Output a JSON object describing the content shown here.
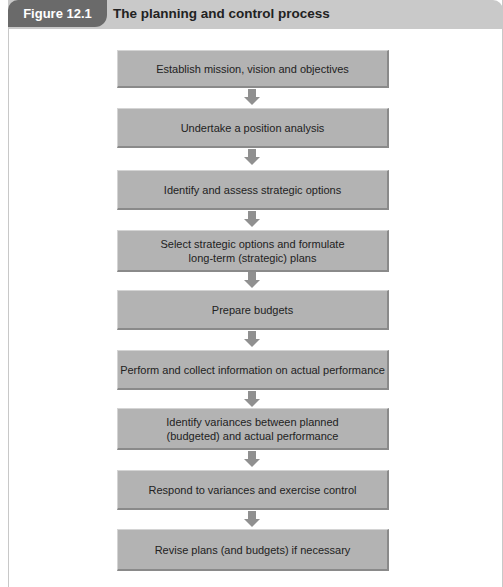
{
  "figure": {
    "label": "Figure 12.1",
    "title": "The planning and control process"
  },
  "steps": [
    {
      "text": "Establish mission, vision and objectives"
    },
    {
      "text": "Undertake a position analysis"
    },
    {
      "text": "Identify and assess strategic options"
    },
    {
      "text": "Select strategic options and formulate long-term (strategic) plans"
    },
    {
      "text": "Prepare budgets"
    },
    {
      "text": "Perform and collect information on actual performance"
    },
    {
      "text": "Identify variances between planned (budgeted) and actual performance"
    },
    {
      "text": "Respond to variances and exercise control"
    },
    {
      "text": "Revise plans (and budgets) if necessary"
    }
  ],
  "colors": {
    "box_fill": "#b3b3b3",
    "arrow": "#909090",
    "label_bg": "#6a6a6a",
    "header_bg": "#c9c9c9"
  }
}
